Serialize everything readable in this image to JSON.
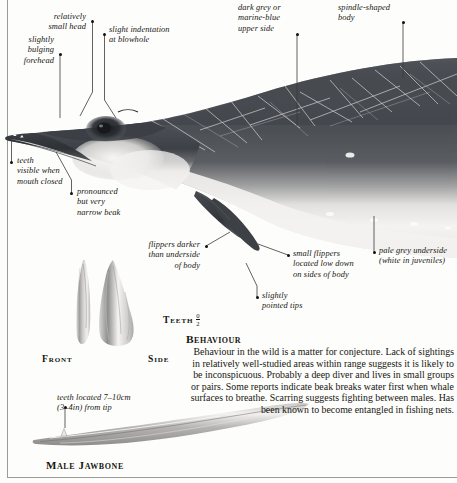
{
  "callouts": [
    {
      "id": "relatively-small-head",
      "text": "relatively\nsmall head",
      "align": "right"
    },
    {
      "id": "slight-indentation",
      "text": "slight indentation\nat blowhole",
      "align": "left"
    },
    {
      "id": "slightly-bulging-forehead",
      "text": "slightly\nbulging\nforehead",
      "align": "right"
    },
    {
      "id": "dark-grey-upper-side",
      "text": "dark grey or\nmarine-blue\nupper side",
      "align": "left"
    },
    {
      "id": "spindle-shaped-body",
      "text": "spindle-shaped\nbody",
      "align": "left"
    },
    {
      "id": "teeth-visible",
      "text": "teeth\nvisible when\nmouth closed",
      "align": "left"
    },
    {
      "id": "pronounced-narrow-beak",
      "text": "pronounced\nbut very\nnarrow beak",
      "align": "left"
    },
    {
      "id": "flippers-darker",
      "text": "flippers darker\nthan underside\nof body",
      "align": "right"
    },
    {
      "id": "small-flippers",
      "text": "small flippers\nlocated low down\non sides of body",
      "align": "left"
    },
    {
      "id": "slightly-pointed-tips",
      "text": "slightly\npointed tips",
      "align": "left"
    },
    {
      "id": "pale-grey-underside",
      "text": "pale grey underside\n(white in juveniles)",
      "align": "left"
    },
    {
      "id": "teeth-located",
      "text": "teeth located 7–10cm\n(3–4in) from tip",
      "align": "left"
    }
  ],
  "figure_labels": {
    "front": "Front",
    "side": "Side",
    "teeth": "Teeth",
    "teeth_formula_numerator": "0",
    "teeth_formula_denominator": "2",
    "male_jawbone": "Male Jawbone"
  },
  "behaviour": {
    "title": "Behaviour",
    "body": "Behaviour in the wild is a matter for conjecture. Lack of sightings in relatively well-studied areas within range suggests it is likely to be inconspicuous. Probably a deep diver and lives in small groups or pairs. Some reports indicate beak breaks water first when whale surfaces to breathe. Scarring suggests fighting between males. Has been known to become entangled in fishing nets."
  },
  "colors": {
    "upper_body_dark": "#4a4d52",
    "upper_body_darkest": "#34373c",
    "underside_pale": "#f2f1ef",
    "flipper_dark": "#3b3e43",
    "page_background": "#fdfdfc",
    "rule": "#9a9a96",
    "text": "#16160f"
  }
}
